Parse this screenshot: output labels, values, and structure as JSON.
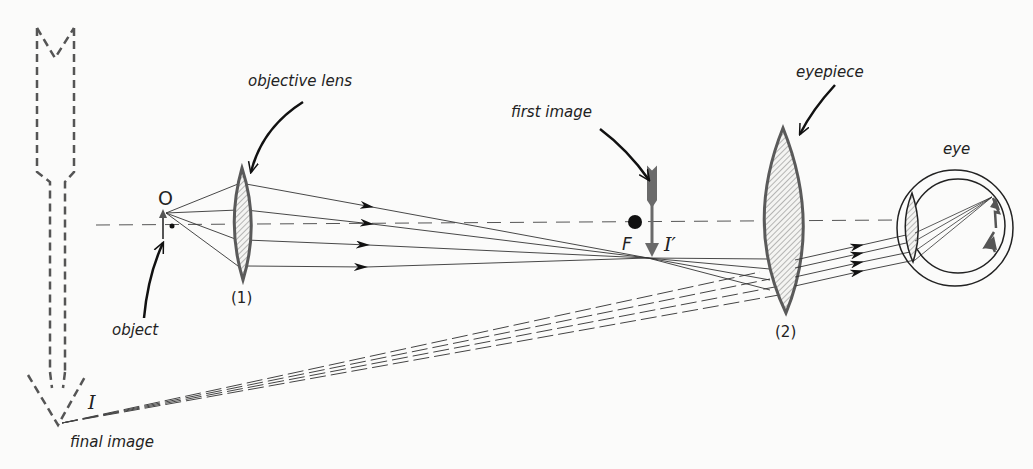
{
  "diagram": {
    "type": "compound-microscope-ray-diagram",
    "labels": {
      "objective_lens": "objective lens",
      "first_image": "first image",
      "eyepiece": "eyepiece",
      "eye": "eye",
      "object": "object",
      "final_image": "final image",
      "lens1_number": "(1)",
      "lens2_number": "(2)",
      "object_symbol": "O",
      "focal_point": "F",
      "first_image_symbol": "I′",
      "final_image_symbol": "I"
    },
    "colors": {
      "ink": "#222222",
      "lens_outline": "#5a5a5a",
      "image_arrow": "#6a6a6a",
      "background": "#fbfbfa"
    }
  }
}
